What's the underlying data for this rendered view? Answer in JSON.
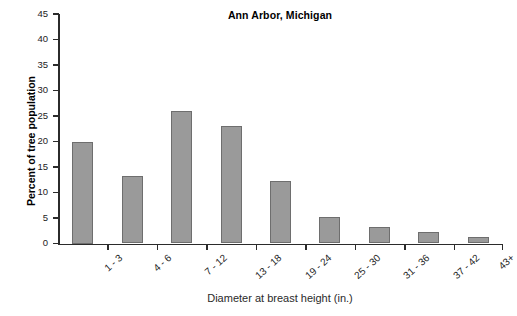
{
  "chart_data": {
    "type": "bar",
    "title": "Ann Arbor, Michigan",
    "xlabel": "Diameter at breast height (in.)",
    "ylabel": "Percent of tree population",
    "categories": [
      "1 - 3",
      "4 - 6",
      "7 - 12",
      "13 - 18",
      "19 - 24",
      "25 - 30",
      "31 - 36",
      "37 - 42",
      "43+"
    ],
    "values": [
      20,
      13.2,
      26,
      23,
      12.2,
      5.2,
      3.3,
      2.3,
      1.3
    ],
    "ylim": [
      0,
      45
    ],
    "ytick_labels": [
      "0",
      "5",
      "10",
      "15",
      "20",
      "25",
      "30",
      "35",
      "40",
      "45"
    ],
    "ytick_values": [
      0,
      5,
      10,
      15,
      20,
      25,
      30,
      35,
      40,
      45
    ],
    "grid": false,
    "legend": "none",
    "bar_color": "#9a9a9a",
    "bar_edge_color": "#6e6e6e",
    "axis_color": "#2b2b2b",
    "background_color": "#ffffff"
  }
}
